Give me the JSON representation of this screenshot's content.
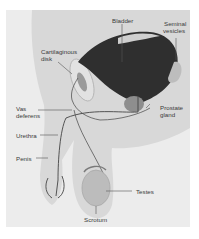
{
  "diagram": {
    "type": "anatomical-illustration",
    "colors": {
      "panel_bg": "#ececec",
      "body_fill": "#d6d6d6",
      "bladder_fill": "#2e2e2e",
      "gland_fill": "#8e8e8e",
      "duct_stroke": "#4a4a4a",
      "label_text": "#3a3a3a",
      "leader_line": "#555555"
    },
    "labels": {
      "bladder": "Bladder",
      "seminal_vesicles_1": "Seminal",
      "seminal_vesicles_2": "vesicles",
      "cartilaginous_disk_1": "Cartilaginous",
      "cartilaginous_disk_2": "disk",
      "vas_deferens_1": "Vas",
      "vas_deferens_2": "deferens",
      "prostate_gland_1": "Prostate",
      "prostate_gland_2": "gland",
      "urethra": "Urethra",
      "penis": "Penis",
      "testes": "Testes",
      "scrotum": "Scrotum"
    }
  }
}
